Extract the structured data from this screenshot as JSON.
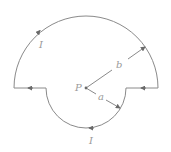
{
  "diagram": {
    "center_label": "P",
    "outer_radius_label": "b",
    "inner_radius_label": "a",
    "current_label_top": "I",
    "current_label_bottom": "I",
    "colors": {
      "wire": "#8a8a8a",
      "arrow": "#6a6a6a",
      "label": "#9a9a9a"
    }
  }
}
